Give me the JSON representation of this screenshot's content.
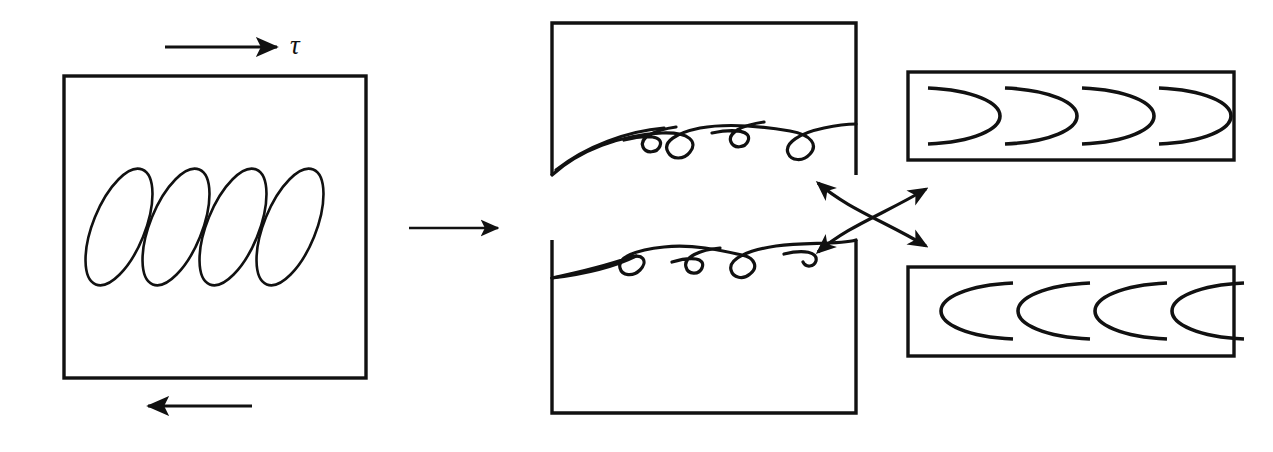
{
  "figure": {
    "background_color": "#ffffff",
    "ink_color": "#111111",
    "width": 1273,
    "height": 452
  },
  "left_panel": {
    "name": "shear-loading-block",
    "description": "Square block under pure shear with four tilted elliptical shear bands",
    "box": {
      "x": 64,
      "y": 76,
      "width": 302,
      "height": 302
    },
    "shear_bands": {
      "count": 4,
      "tilt_degrees": 22,
      "rx": 26,
      "ry": 62,
      "centers_x": [
        119,
        176,
        233,
        290
      ],
      "center_y": 227
    },
    "top_arrow": {
      "label": "τ",
      "label_name": "tau",
      "direction": "right",
      "x1": 165,
      "x2": 283,
      "y": 47
    },
    "bottom_arrow": {
      "label": "",
      "direction": "left",
      "x1": 252,
      "x2": 142,
      "y": 406
    }
  },
  "transition_arrow": {
    "name": "transition-arrow",
    "direction": "right",
    "x1": 409,
    "x2": 504,
    "y": 228
  },
  "middle_panel": {
    "name": "separated-fracture-halves",
    "description": "Upper and lower fracture halves separated, showing elongated shear dimple ridges",
    "upper_box": {
      "x": 552,
      "y": 23,
      "width": 304,
      "height": 152
    },
    "lower_box": {
      "x": 552,
      "y": 240,
      "width": 304,
      "height": 173
    },
    "upper_surface": {
      "name": "upper-fracture-surface",
      "hook_count": 4,
      "orientation": "hooks-open-left-tails-down"
    },
    "lower_surface": {
      "name": "lower-fracture-surface",
      "hook_count": 4,
      "orientation": "hooks-open-left-tails-up"
    }
  },
  "crossing_arrows": {
    "name": "crossing-correspondence-arrows",
    "description": "Two crossed curved arrows linking each fracture half to its matching dimple inset",
    "arrowhead_count": 4,
    "center_x": 866,
    "center_y": 217
  },
  "top_inset": {
    "name": "upper-dimple-inset",
    "description": "Plan view of upper fracture surface: elongated parabolic shear dimples opening to the left",
    "box": {
      "x": 908,
      "y": 72,
      "width": 326,
      "height": 88
    },
    "dimples": {
      "count": 4,
      "opening": "left",
      "centers_x": [
        958,
        1035,
        1112,
        1189
      ],
      "center_y": 116,
      "rx": 40,
      "ry": 31
    }
  },
  "bottom_inset": {
    "name": "lower-dimple-inset",
    "description": "Plan view of lower fracture surface: elongated parabolic shear dimples opening to the right",
    "box": {
      "x": 908,
      "y": 267,
      "width": 326,
      "height": 89
    },
    "dimples": {
      "count": 4,
      "opening": "right",
      "centers_x": [
        985,
        1062,
        1139,
        1216
      ],
      "center_y": 311,
      "rx": 40,
      "ry": 31
    }
  }
}
